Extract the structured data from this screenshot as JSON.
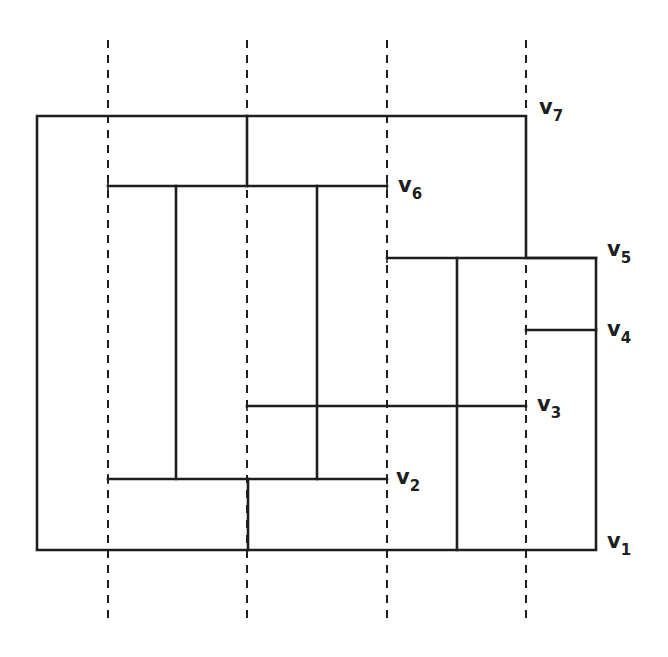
{
  "diagram": {
    "title": "",
    "stroke_color": "#1e1e1e",
    "background": "#ffffff",
    "dashed_lines": [
      {
        "id": "d1",
        "x": 108,
        "y1": 40,
        "y2": 624
      },
      {
        "id": "d2",
        "x": 247,
        "y1": 40,
        "y2": 624
      },
      {
        "id": "d3",
        "x": 387,
        "y1": 40,
        "y2": 624
      },
      {
        "id": "d4",
        "x": 526,
        "y1": 40,
        "y2": 624
      }
    ],
    "outer_boundary": [
      [
        37,
        116
      ],
      [
        526,
        116
      ],
      [
        526,
        258
      ],
      [
        596,
        258
      ],
      [
        596,
        550
      ],
      [
        37,
        550
      ]
    ],
    "segments": [
      {
        "id": "v6-line",
        "x1": 108,
        "y1": 186,
        "x2": 387,
        "y2": 186
      },
      {
        "id": "v5-line",
        "x1": 387,
        "y1": 258,
        "x2": 596,
        "y2": 258
      },
      {
        "id": "v4-line",
        "x1": 526,
        "y1": 330,
        "x2": 596,
        "y2": 330
      },
      {
        "id": "v3-line",
        "x1": 247,
        "y1": 406,
        "x2": 526,
        "y2": 406
      },
      {
        "id": "v2-line",
        "x1": 108,
        "y1": 479,
        "x2": 387,
        "y2": 479
      },
      {
        "id": "top-divider",
        "x1": 247,
        "y1": 116,
        "x2": 247,
        "y2": 186
      },
      {
        "id": "left-inner",
        "x1": 176,
        "y1": 186,
        "x2": 176,
        "y2": 479
      },
      {
        "id": "mid-inner",
        "x1": 317,
        "y1": 186,
        "x2": 317,
        "y2": 479
      },
      {
        "id": "bottom-divider",
        "x1": 248,
        "y1": 479,
        "x2": 248,
        "y2": 550
      },
      {
        "id": "right-inner",
        "x1": 457,
        "y1": 258,
        "x2": 457,
        "y2": 550
      }
    ],
    "labels": [
      {
        "id": "v1",
        "base": "v",
        "sub": "1",
        "x": 607,
        "y": 548
      },
      {
        "id": "v2",
        "base": "v",
        "sub": "2",
        "x": 396,
        "y": 484
      },
      {
        "id": "v3",
        "base": "v",
        "sub": "3",
        "x": 537,
        "y": 411
      },
      {
        "id": "v4",
        "base": "v",
        "sub": "4",
        "x": 607,
        "y": 336
      },
      {
        "id": "v5",
        "base": "v",
        "sub": "5",
        "x": 607,
        "y": 256
      },
      {
        "id": "v6",
        "base": "v",
        "sub": "6",
        "x": 398,
        "y": 192
      },
      {
        "id": "v7",
        "base": "v",
        "sub": "7",
        "x": 539,
        "y": 114
      }
    ]
  }
}
